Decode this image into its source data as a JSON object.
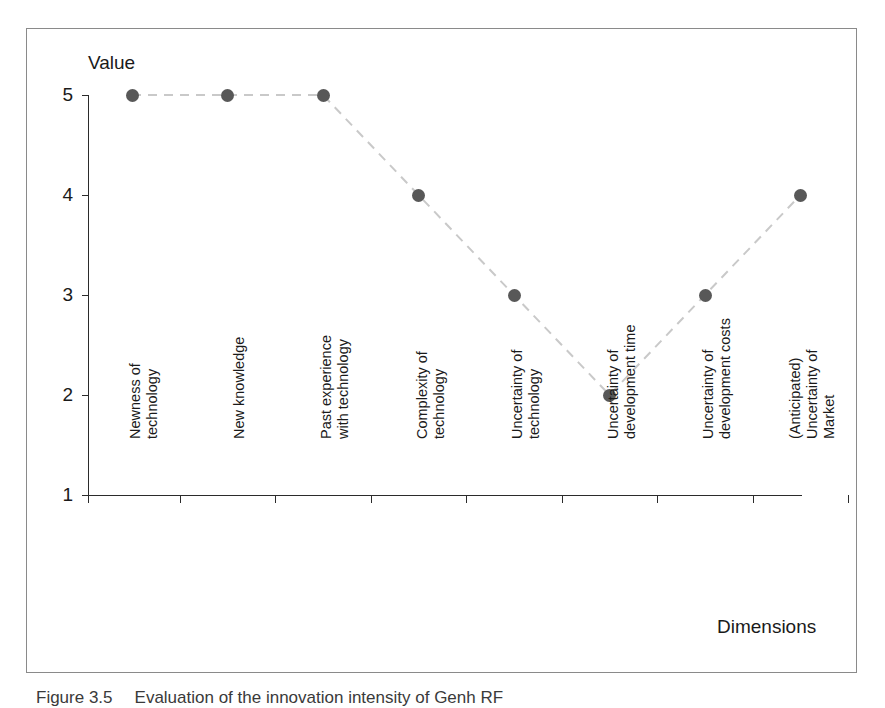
{
  "figure": {
    "caption_label": "Figure 3.5",
    "caption_text": "Evaluation of the innovation intensity of Genh RF"
  },
  "chart_data": {
    "type": "line",
    "title": "",
    "xlabel": "Dimensions",
    "ylabel": "Value",
    "ylim": [
      1,
      5
    ],
    "yticks": [
      1,
      2,
      3,
      4,
      5
    ],
    "ytick_labels": [
      "1",
      "2",
      "3",
      "4",
      "5"
    ],
    "grid": false,
    "legend": "none",
    "line_style": "dashed",
    "line_color": "#c9c9c9",
    "marker": "circle",
    "marker_color": "#585858",
    "categories": [
      "Newness of\ntechnology",
      "New knowledge",
      "Past experience\nwith technology",
      "Complexity of\ntechnology",
      "Uncertainty of\ntechnology",
      "Uncertainty of\ndevelopment time",
      "Uncertainty of\ndevelopment costs",
      "(Anticipated)\nUncertainty of\nMarket"
    ],
    "values": [
      5,
      5,
      5,
      4,
      3,
      2,
      3,
      4
    ]
  },
  "colors": {
    "frame_border": "#8a8a8a",
    "axis": "#2b2b2b",
    "marker": "#585858",
    "line": "#c9c9c9",
    "text": "#1a1a1a",
    "background": "#ffffff"
  }
}
